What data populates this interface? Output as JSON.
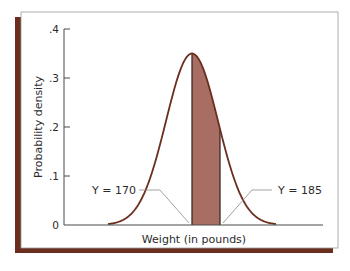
{
  "chart_data": {
    "type": "area",
    "title": "",
    "xlabel": "Weight (in pounds)",
    "ylabel": "Probability density",
    "ylim": [
      0,
      0.4
    ],
    "yticks": [
      {
        "value": 0,
        "label": "0"
      },
      {
        "value": 0.1,
        "label": ".1"
      },
      {
        "value": 0.2,
        "label": ".2"
      },
      {
        "value": 0.3,
        "label": ".3"
      },
      {
        "value": 0.4,
        "label": ".4"
      }
    ],
    "xticks": [],
    "grid": false,
    "legend": null,
    "series": [
      {
        "name": "Normal density curve",
        "distribution": "normal",
        "peak_density": 0.35,
        "color": "#6b2e1e"
      }
    ],
    "shaded_region": {
      "from_label": "Y = 170",
      "to_label": "Y = 185",
      "from": 170,
      "to": 185,
      "fill": "#a86e64",
      "description": "Area under the curve between Y = 170 and Y = 185"
    },
    "annotations": [
      {
        "text": "Y = 170",
        "points_to": "left edge of shaded region"
      },
      {
        "text": "Y = 185",
        "points_to": "right edge of shaded region"
      }
    ]
  },
  "colors": {
    "frame_shadow": "#6b2e1e",
    "curve": "#6b2e1e",
    "shade": "#a86e64",
    "axis": "#4a4a4a",
    "leader": "#8a8a8a",
    "panel": "#ffffff",
    "panel_border": "#9a9a9a"
  }
}
